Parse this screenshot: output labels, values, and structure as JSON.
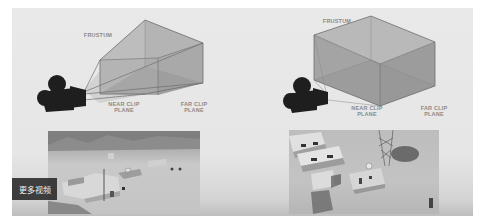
{
  "slide": {
    "left_diagram": {
      "frustum_label": "FRUSTUM",
      "near_clip_label": "NEAR CLIP\nPLANE",
      "near_clip_line1": "NEAR CLIP",
      "near_clip_line2": "PLANE",
      "far_clip_line1": "FAR CLIP",
      "far_clip_line2": "PLANE",
      "projection": "perspective"
    },
    "right_diagram": {
      "frustum_label": "FRUSTUM",
      "near_clip_line1": "NEAR CLIP",
      "near_clip_line2": "PLANE",
      "far_clip_line1": "FAR CLIP",
      "far_clip_line2": "PLANE",
      "projection": "orthographic"
    },
    "icons": [
      "camera-icon",
      "camera-icon"
    ],
    "colors": {
      "background": "#e8e8e8",
      "frustum_fill": "#a8a8a8",
      "frustum_edge": "#6e6e6e",
      "camera": "#1e1e1e",
      "label": "#8a8a8a"
    }
  },
  "overlay": {
    "more_videos_label": "更多视频"
  }
}
